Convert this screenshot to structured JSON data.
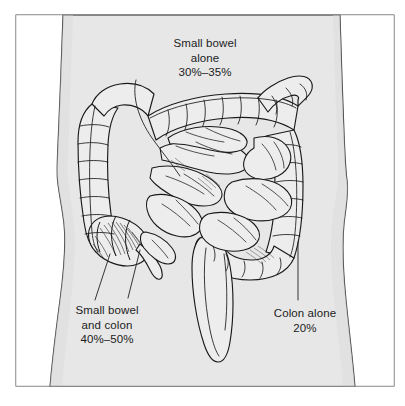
{
  "figure": {
    "kind": "medical-illustration",
    "background_color": "#ffffff",
    "frame_color": "#4a4a4a",
    "body_fill": "#e7e7e7",
    "body_outline": "#3a3a3a",
    "organ_fill": "#ededed",
    "organ_outline": "#1a1a1a",
    "label_color": "#1c1c1c"
  },
  "annotations": {
    "small_bowel_alone": {
      "line1": "Small bowel",
      "line2": "alone",
      "line3": "30%–35%"
    },
    "small_bowel_and_colon": {
      "line1": "Small bowel",
      "line2": "and colon",
      "line3": "40%–50%"
    },
    "colon_alone": {
      "line1": "Colon alone",
      "line2": "20%"
    }
  },
  "anatomy": {
    "parts": [
      "torso-silhouette",
      "ascending-colon",
      "hepatic-flexure",
      "transverse-colon",
      "splenic-flexure",
      "descending-colon",
      "sigmoid-colon",
      "rectum",
      "cecum",
      "appendix",
      "terminal-ileum",
      "small-bowel-loops"
    ]
  }
}
